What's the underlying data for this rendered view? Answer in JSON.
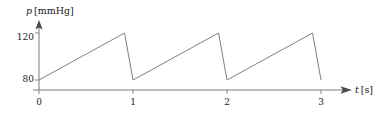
{
  "chart_data": {
    "type": "line",
    "title": "",
    "subtitle": "",
    "xlabel_var": "t",
    "xlabel_unit": "[s]",
    "ylabel_var": "p",
    "ylabel_unit": "[mmHg]",
    "xlabel": "t [s]",
    "ylabel": "p [mmHg]",
    "xlim": [
      0,
      3.3
    ],
    "ylim": [
      72,
      128
    ],
    "xticks": [
      0,
      1,
      2,
      3
    ],
    "xtick_labels": [
      "0",
      "1",
      "2",
      "3"
    ],
    "yticks": [
      80,
      120
    ],
    "ytick_labels": [
      "80",
      "120"
    ],
    "grid": false,
    "legend": null,
    "axis_style": "arrow",
    "annotations": [],
    "series": [
      {
        "name": "arterial pressure",
        "color": "#808080",
        "linewidth": 1,
        "x": [
          0.0,
          0.91,
          1.0,
          1.91,
          2.0,
          2.91,
          3.0
        ],
        "y": [
          80,
          120,
          80,
          120,
          80,
          120,
          80
        ]
      }
    ],
    "waveform": {
      "shape": "sawtooth",
      "cycles": 3,
      "period_s": 1,
      "diastolic_mmHg": 80,
      "systolic_mmHg": 120,
      "rise_fraction": 0.91,
      "fall_fraction": 0.09
    }
  },
  "colors": {
    "curve": "#808080",
    "axis": "#7a7a7a",
    "text": "#1a1a1a",
    "background": "#ffffff"
  }
}
